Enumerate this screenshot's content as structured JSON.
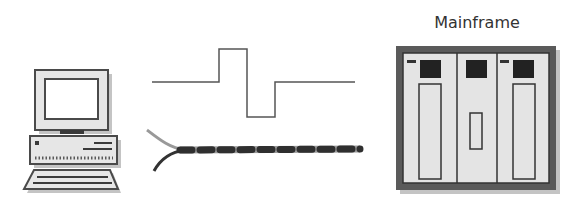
{
  "diagram": {
    "mainframe_label": "Mainframe",
    "nodes": [
      {
        "id": "pc",
        "type": "personal-computer"
      },
      {
        "id": "signal",
        "type": "digital-signal-waveform"
      },
      {
        "id": "cable",
        "type": "twisted-pair-cable"
      },
      {
        "id": "mainframe",
        "type": "mainframe",
        "label": "Mainframe"
      }
    ],
    "colors": {
      "stroke": "#4a4a4a",
      "panel": "#e4e4e4",
      "dark": "#2a2a2a",
      "shadow": "#bdbdbd"
    }
  }
}
